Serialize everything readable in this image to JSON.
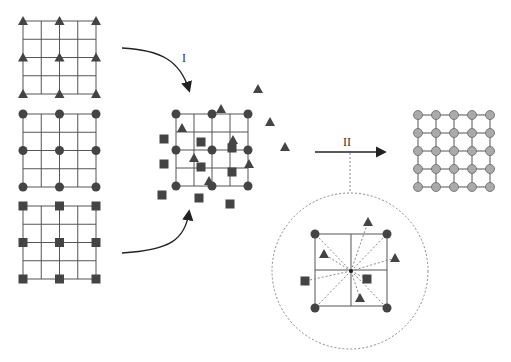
{
  "diagram": {
    "labels": {
      "step1": "I",
      "step2": "II"
    },
    "colors": {
      "line": "#555555",
      "marker": "#444444",
      "output_node": "#aaaaaa",
      "dashed": "#888888"
    },
    "input_grids": [
      {
        "name": "triangle-grid",
        "marker": "triangle"
      },
      {
        "name": "circle-grid",
        "marker": "circle"
      },
      {
        "name": "square-grid",
        "marker": "square"
      }
    ],
    "output_grid": {
      "rows": 5,
      "cols": 5,
      "marker": "circle"
    }
  }
}
